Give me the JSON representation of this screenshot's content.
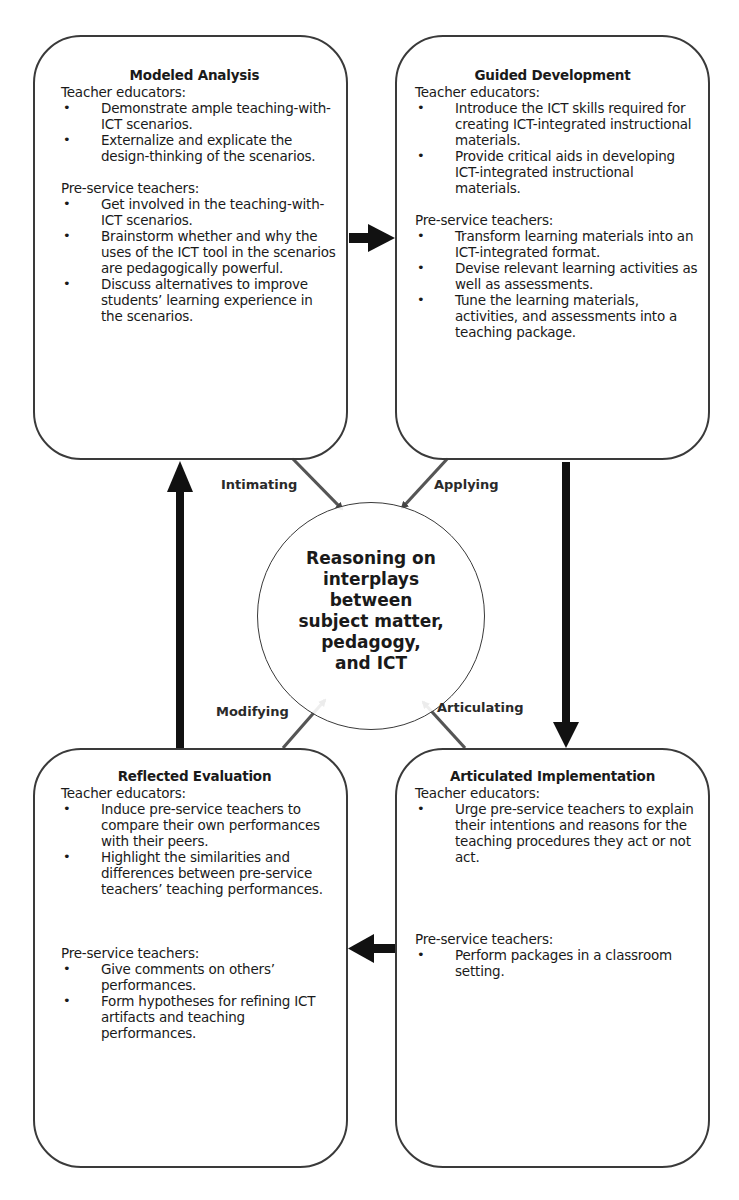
{
  "diagram": {
    "center": {
      "lines": [
        "Reasoning on",
        "interplays",
        "between",
        "subject matter,",
        "pedagogy,",
        "and ICT"
      ]
    },
    "edge_labels": {
      "intimating": "Intimating",
      "applying": "Applying",
      "modifying": "Modifying",
      "articulating": "Articulating"
    },
    "boxes": {
      "modeled_analysis": {
        "title": "Modeled Analysis",
        "teacher_educators": {
          "label": "Teacher educators:",
          "items": [
            "Demonstrate ample teaching-with-ICT scenarios.",
            "Externalize and explicate the design-thinking of the scenarios."
          ]
        },
        "pre_service": {
          "label": "Pre-service teachers:",
          "items": [
            "Get involved in the teaching-with-ICT scenarios.",
            "Brainstorm whether and why the uses of the ICT tool in the scenarios are pedagogically powerful.",
            "Discuss alternatives to improve students’ learning experience in the scenarios."
          ]
        }
      },
      "guided_development": {
        "title": "Guided Development",
        "teacher_educators": {
          "label": "Teacher educators:",
          "items": [
            "Introduce the ICT skills required for creating ICT-integrated instructional materials.",
            "Provide critical aids in developing ICT-integrated instructional materials."
          ]
        },
        "pre_service": {
          "label": "Pre-service teachers:",
          "items": [
            "Transform learning materials into an ICT-integrated format.",
            "Devise relevant learning activities as well as assessments.",
            "Tune the learning materials, activities, and assessments into a teaching package."
          ]
        }
      },
      "reflected_evaluation": {
        "title": "Reflected Evaluation",
        "teacher_educators": {
          "label": "Teacher educators:",
          "items": [
            "Induce pre-service teachers to compare their own performances with their peers.",
            "Highlight the similarities and differences between pre-service teachers’ teaching performances."
          ]
        },
        "pre_service": {
          "label": "Pre-service teachers:",
          "items": [
            "Give comments on others’ performances.",
            "Form hypotheses for refining ICT artifacts and teaching performances."
          ]
        }
      },
      "articulated_implementation": {
        "title": "Articulated Implementation",
        "teacher_educators": {
          "label": "Teacher educators:",
          "items": [
            "Urge pre-service teachers to explain their intentions and reasons for the teaching procedures they act or not act."
          ]
        },
        "pre_service": {
          "label": "Pre-service teachers:",
          "items": [
            "Perform packages in a classroom setting."
          ]
        }
      }
    },
    "flow": [
      "Modeled Analysis → Guided Development",
      "Guided Development → Articulated Implementation",
      "Articulated Implementation → Reflected Evaluation",
      "Reflected Evaluation → Modeled Analysis"
    ]
  },
  "colors": {
    "line": "#3a3a3a",
    "arrow": "#111111",
    "text": "#1a1a1a",
    "background": "#ffffff"
  }
}
